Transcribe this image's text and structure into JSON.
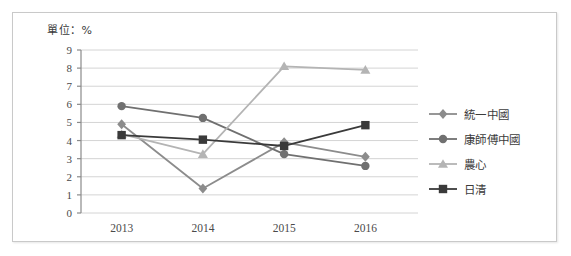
{
  "chart_data": {
    "type": "line",
    "title": "單位：%",
    "xlabel": "",
    "ylabel": "",
    "categories": [
      "2013",
      "2014",
      "2015",
      "2016"
    ],
    "ylim": [
      0,
      9
    ],
    "ytick_labels": [
      "0",
      "1",
      "2",
      "3",
      "4",
      "5",
      "6",
      "7",
      "8",
      "9"
    ],
    "grid": true,
    "legend_position": "right",
    "series": [
      {
        "name": "統一中國",
        "marker": "diamond",
        "color": "#8c8c8c",
        "values": [
          4.9,
          1.35,
          3.9,
          3.1
        ]
      },
      {
        "name": "康師傅中國",
        "marker": "circle",
        "color": "#707070",
        "values": [
          5.9,
          5.25,
          3.25,
          2.6
        ]
      },
      {
        "name": "農心",
        "marker": "triangle",
        "color": "#b4b4b4",
        "values": [
          4.35,
          3.25,
          8.1,
          7.9
        ]
      },
      {
        "name": "日清",
        "marker": "square",
        "color": "#3a3a3a",
        "values": [
          4.3,
          4.05,
          3.7,
          4.85
        ]
      }
    ]
  },
  "legend": {
    "items": [
      {
        "label": "統一中國",
        "marker": "diamond",
        "color": "#8c8c8c"
      },
      {
        "label": "康師傅中國",
        "marker": "circle",
        "color": "#707070"
      },
      {
        "label": "農心",
        "marker": "triangle",
        "color": "#b4b4b4"
      },
      {
        "label": "日清",
        "marker": "square",
        "color": "#3a3a3a"
      }
    ]
  },
  "axes": {
    "y_values": [
      9,
      8,
      7,
      6,
      5,
      4,
      3,
      2,
      1,
      0
    ],
    "x_values": [
      "2013",
      "2014",
      "2015",
      "2016"
    ]
  },
  "colors": {
    "border": "#c9c9c9",
    "grid": "#d4d4d4",
    "axis": "#8a8a8a",
    "text": "#4a4a4a",
    "background": "#ffffff"
  }
}
